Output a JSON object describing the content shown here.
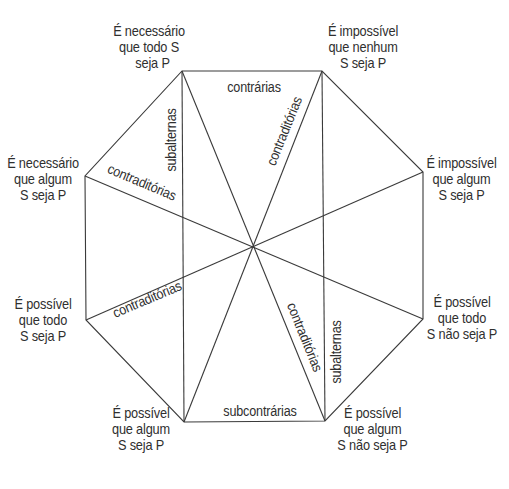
{
  "diagram": {
    "type": "modal-octagon-of-opposition",
    "vertices": {
      "top_left": {
        "id": "TL",
        "lines": [
          "É necessário",
          "que todo S",
          "seja P"
        ]
      },
      "top_right": {
        "id": "TR",
        "lines": [
          "É impossível",
          "que nenhum",
          "S seja P"
        ]
      },
      "right_upper": {
        "id": "RU",
        "lines": [
          "É impossível",
          "que algum",
          "S seja P"
        ]
      },
      "right_lower": {
        "id": "RL",
        "lines": [
          "É possível",
          "que todo",
          "S não seja P"
        ]
      },
      "bottom_right": {
        "id": "BR",
        "lines": [
          "É possível",
          "que algum",
          "S não seja P"
        ]
      },
      "bottom_left": {
        "id": "BL",
        "lines": [
          "É possível",
          "que algum",
          "S seja P"
        ]
      },
      "left_lower": {
        "id": "LL",
        "lines": [
          "É possível",
          "que todo",
          "S seja P"
        ]
      },
      "left_upper": {
        "id": "LU",
        "lines": [
          "É necessário",
          "que algum",
          "S seja P"
        ]
      }
    },
    "relations": {
      "top_edge": "contrárias",
      "bottom_edge": "subcontrárias",
      "left_vertical": "subalternas",
      "right_vertical": "subalternas",
      "diagonal_tr_bl": "contraditórias",
      "diagonal_tl_br": "contraditórias",
      "cross_lu_rl": "contraditórias",
      "cross_ru_ll": "contraditórias"
    },
    "colors": {
      "line": "#3a3a3a",
      "text": "#2f2f2f",
      "background": "#ffffff"
    }
  }
}
